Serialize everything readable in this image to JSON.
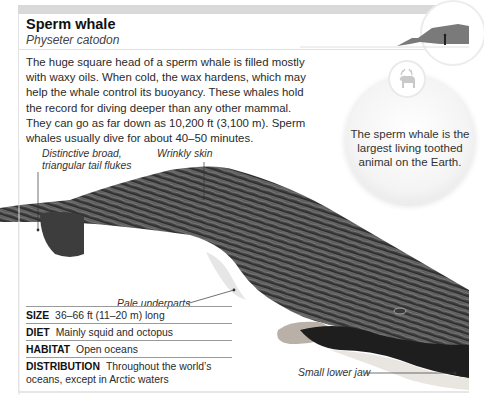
{
  "header": {
    "title": "Sperm whale",
    "subtitle": "Physeter catodon"
  },
  "intro": "The huge square head of a sperm whale is filled mostly with waxy oils. When cold, the wax hardens, which may help the whale control its buoyancy. These whales hold the record for diving deeper than any other mammal. They can go as far down as 10,200 ft (3,100 m). Sperm whales usually dive for about 40–50 minutes.",
  "scale_icon": "whale-vs-human-scale-icon",
  "fact_bubble": {
    "icon": "reindeer-icon",
    "text": "The sperm whale is the largest living toothed animal on the Earth."
  },
  "labels": {
    "tail": "Distinctive broad, triangular tail flukes",
    "skin": "Wrinkly skin",
    "underparts": "Pale underparts",
    "jaw": "Small lower jaw"
  },
  "facts": [
    {
      "key": "SIZE",
      "value": "36–66 ft (11–20 m) long"
    },
    {
      "key": "DIET",
      "value": "Mainly squid and octopus"
    },
    {
      "key": "HABITAT",
      "value": "Open oceans"
    },
    {
      "key": "DISTRIBUTION",
      "value": "Throughout the world’s oceans, except in Arctic waters"
    }
  ],
  "colors": {
    "band": "#d9d9d9",
    "text": "#231f20",
    "whale_dark": "#3a3a3a",
    "whale_light": "#e8e8e8"
  }
}
